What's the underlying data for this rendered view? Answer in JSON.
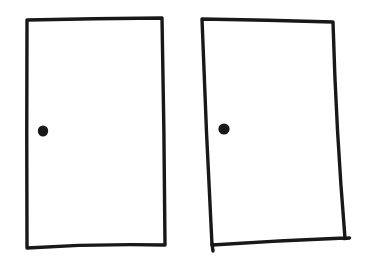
{
  "canvas": {
    "width": 366,
    "height": 264,
    "background": "#ffffff"
  },
  "style": {
    "stroke_color": "#181818",
    "stroke_width": 3.4
  },
  "shapes": [
    {
      "id": "left-rectangle",
      "kind": "quad",
      "corners": [
        [
          27,
          20
        ],
        [
          162,
          18
        ],
        [
          165,
          245
        ],
        [
          27,
          248
        ]
      ],
      "bows": [
        0.5,
        0.8,
        -3,
        0.5
      ]
    },
    {
      "id": "right-rectangle",
      "kind": "quad",
      "corners": [
        [
          202,
          19
        ],
        [
          333,
          22
        ],
        [
          345,
          238
        ],
        [
          212,
          245
        ]
      ],
      "bows": [
        0.5,
        -3,
        -1,
        1
      ]
    },
    {
      "id": "right-rectangle-overshoot-bottom-left",
      "kind": "segment",
      "from": [
        212,
        244
      ],
      "to": [
        213,
        251
      ]
    },
    {
      "id": "right-rectangle-overshoot-bottom-right",
      "kind": "segment",
      "from": [
        344,
        238.5
      ],
      "to": [
        349.5,
        238
      ]
    },
    {
      "id": "left-dot",
      "kind": "dot",
      "center": [
        43,
        131
      ],
      "rx": 5.2,
      "ry": 5.6
    },
    {
      "id": "right-dot",
      "kind": "dot",
      "center": [
        224,
        129
      ],
      "rx": 5.6,
      "ry": 5.6
    }
  ]
}
